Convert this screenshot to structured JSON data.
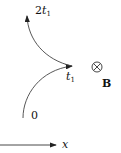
{
  "diagram": {
    "labels": {
      "t_top_coeff": "2",
      "t_top_var": "t",
      "t_top_sub": "1",
      "t_mid_var": "t",
      "t_mid_sub": "1",
      "origin": "0",
      "field": "B",
      "field_symbol": "⊗",
      "axis": "x"
    },
    "colors": {
      "stroke": "#222222",
      "background": "#ffffff"
    }
  }
}
